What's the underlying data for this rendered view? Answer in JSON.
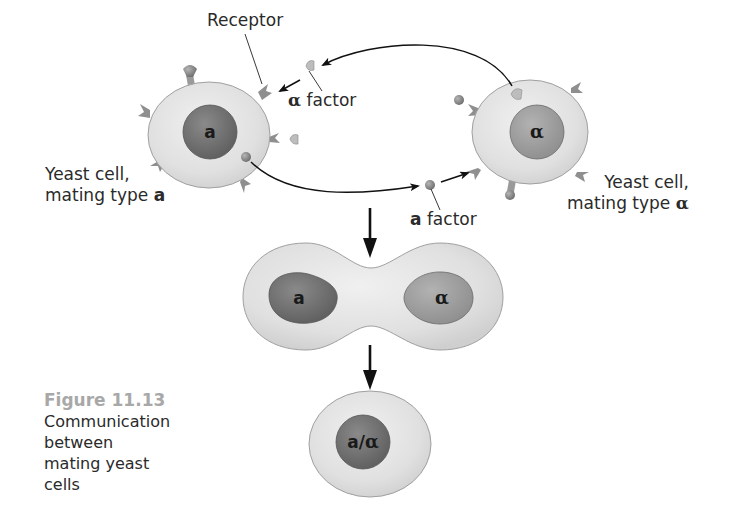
{
  "figure": {
    "number": "Figure 11.13",
    "caption": "Communication between mating yeast cells"
  },
  "labels": {
    "receptor": "Receptor",
    "alpha_factor_symbol": "α",
    "alpha_factor_text": " factor",
    "a_factor_symbol": "a",
    "a_factor_text": " factor",
    "left_cell_line1": "Yeast cell,",
    "left_cell_line2": "mating type ",
    "left_cell_type": "a",
    "right_cell_line1": "Yeast cell,",
    "right_cell_line2": "mating type ",
    "right_cell_type": "α"
  },
  "nuclei": {
    "left": "a",
    "right": "α",
    "fused_left": "a",
    "fused_right": "α",
    "result": "a/α"
  },
  "colors": {
    "cell_fill": "#e3e3e3",
    "cell_stroke": "#9a9a9a",
    "nucleus_a": "#6e6e6e",
    "nucleus_alpha": "#9c9c9c",
    "arrow": "#111111",
    "caption_number": "#a8a8a8"
  }
}
